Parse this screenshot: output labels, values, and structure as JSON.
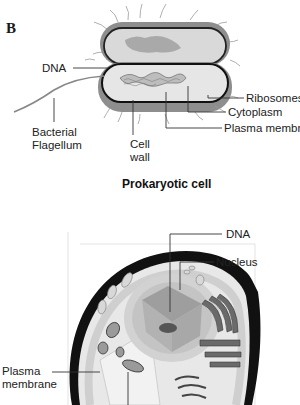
{
  "figure": {
    "panel_letter": "B",
    "prokaryote": {
      "caption": "Prokaryotic cell",
      "labels": {
        "dna": "DNA",
        "ribosomes": "Ribosomes",
        "cytoplasm": "Cytoplasm",
        "plasma_membrane": "Plasma membrane",
        "flagellum_line1": "Bacterial",
        "flagellum_line2": "Flagellum",
        "cell_wall_line1": "Cell",
        "cell_wall_line2": "wall"
      }
    },
    "eukaryote": {
      "labels": {
        "dna": "DNA",
        "nucleus": "Nucleus",
        "plasma_membrane_line1": "Plasma",
        "plasma_membrane_line2": "membrane"
      }
    }
  }
}
